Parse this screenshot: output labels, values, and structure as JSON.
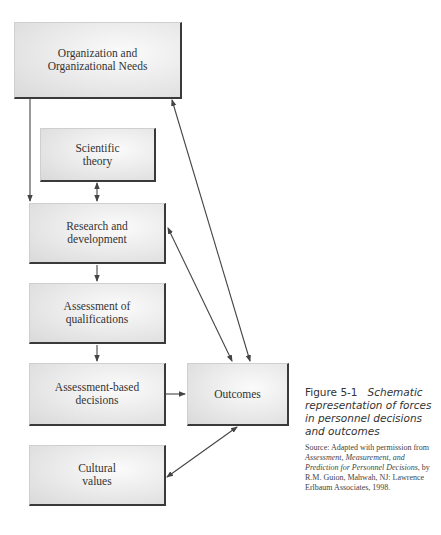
{
  "diagram": {
    "nodes": [
      {
        "id": "org",
        "label": "Organization and\nOrganizational Needs"
      },
      {
        "id": "sci",
        "label": "Scientific\ntheory"
      },
      {
        "id": "rd",
        "label": "Research and\ndevelopment"
      },
      {
        "id": "aq",
        "label": "Assessment of\nqualifications"
      },
      {
        "id": "abd",
        "label": "Assessment-based\ndecisions"
      },
      {
        "id": "out",
        "label": "Outcomes"
      },
      {
        "id": "cul",
        "label": "Cultural\nvalues"
      }
    ],
    "edges": [
      {
        "from": "org",
        "to": "rd",
        "type": "one-way"
      },
      {
        "from": "sci",
        "to": "rd",
        "type": "two-way"
      },
      {
        "from": "rd",
        "to": "aq",
        "type": "one-way"
      },
      {
        "from": "aq",
        "to": "abd",
        "type": "one-way"
      },
      {
        "from": "abd",
        "to": "out",
        "type": "one-way"
      },
      {
        "from": "org",
        "to": "out",
        "type": "two-way"
      },
      {
        "from": "rd",
        "to": "out",
        "type": "two-way"
      },
      {
        "from": "out",
        "to": "cul",
        "type": "two-way"
      }
    ]
  },
  "caption": {
    "figure_number": "Figure 5-1",
    "title": "Schematic representation of forces in personnel decisions and outcomes",
    "source_prefix": "Source: Adapted with permission from ",
    "source_book": "Assessment, Measurement, and Prediction for Personnel Decisions",
    "source_suffix": ", by R.M. Guion, Mahwah, NJ: Lawrence Erlbaum Associates, 1998."
  }
}
